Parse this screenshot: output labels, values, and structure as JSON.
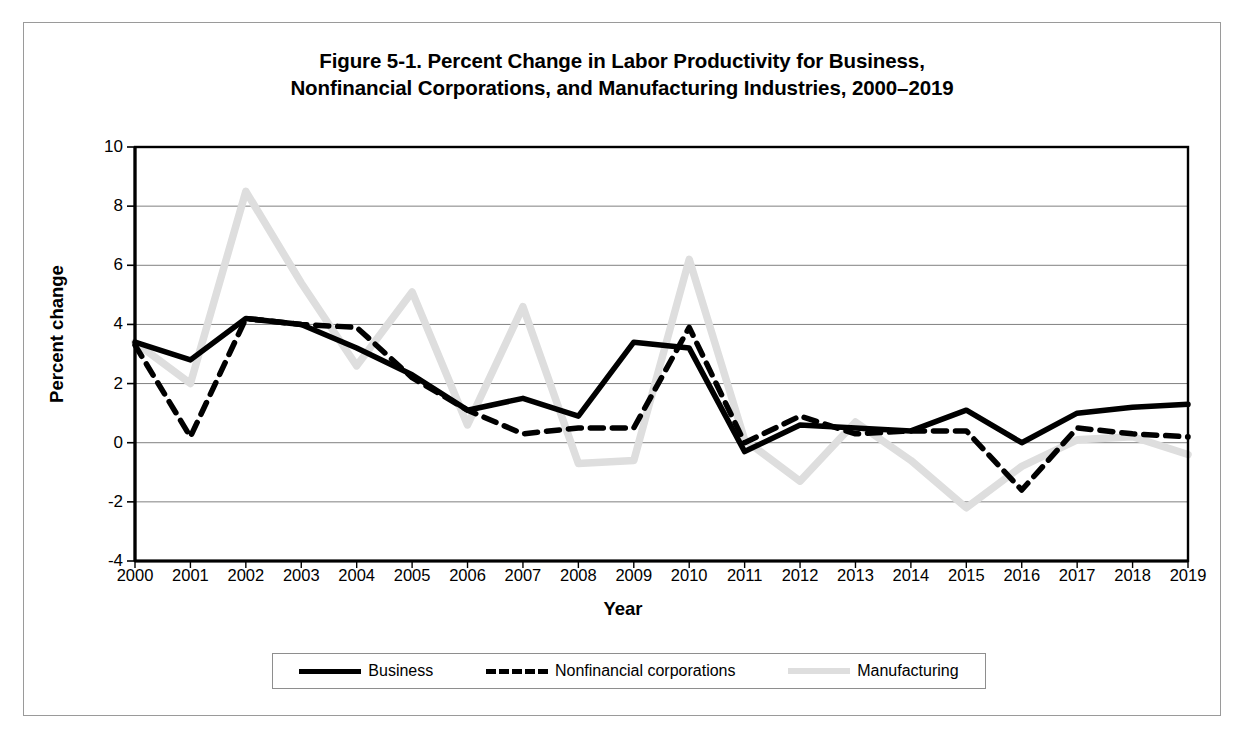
{
  "figure": {
    "title_line1": "Figure 5-1. Percent Change in Labor Productivity for Business,",
    "title_line2": "Nonfinancial Corporations, and Manufacturing Industries, 2000–2019"
  },
  "colors": {
    "business": "#000000",
    "nonfinancial": "#000000",
    "manufacturing": "#dedede",
    "gridline": "#808080",
    "axis": "#000000",
    "frame": "#9a9a9a"
  },
  "chart_data": {
    "type": "line",
    "title": "Figure 5-1. Percent Change in Labor Productivity for Business, Nonfinancial Corporations, and Manufacturing Industries, 2000–2019",
    "xlabel": "Year",
    "ylabel": "Percent change",
    "categories": [
      2000,
      2001,
      2002,
      2003,
      2004,
      2005,
      2006,
      2007,
      2008,
      2009,
      2010,
      2011,
      2012,
      2013,
      2014,
      2015,
      2016,
      2017,
      2018,
      2019
    ],
    "xtick_labels": [
      "2000",
      "2001",
      "2002",
      "2003",
      "2004",
      "2005",
      "2006",
      "2007",
      "2008",
      "2009",
      "2010",
      "2011",
      "2012",
      "2013",
      "2014",
      "2015",
      "2016",
      "2017",
      "2018",
      "2019"
    ],
    "ylim": [
      -4,
      10
    ],
    "yticks": [
      10,
      8,
      6,
      4,
      2,
      0,
      -2,
      -4
    ],
    "ytick_labels": [
      "10",
      "8",
      "6",
      "4",
      "2",
      "0",
      "-2",
      "-4"
    ],
    "grid": true,
    "legend_position": "bottom",
    "series": [
      {
        "name": "Business",
        "style": "solid",
        "color": "#000000",
        "values": [
          3.4,
          2.8,
          4.2,
          4.0,
          3.2,
          2.3,
          1.1,
          1.5,
          0.9,
          3.4,
          3.2,
          -0.3,
          0.6,
          0.5,
          0.4,
          1.1,
          0.0,
          1.0,
          1.2,
          1.3
        ]
      },
      {
        "name": "Nonfinancial corporations",
        "style": "dashed",
        "color": "#000000",
        "values": [
          3.3,
          0.2,
          4.2,
          4.0,
          3.9,
          2.2,
          1.1,
          0.3,
          0.5,
          0.5,
          3.9,
          0.0,
          0.9,
          0.3,
          0.4,
          0.4,
          -1.6,
          0.5,
          0.3,
          0.2
        ]
      },
      {
        "name": "Manufacturing",
        "style": "light-solid",
        "color": "#dedede",
        "values": [
          3.4,
          2.0,
          8.5,
          5.4,
          2.6,
          5.1,
          0.6,
          4.6,
          -0.7,
          -0.6,
          6.2,
          0.1,
          -1.3,
          0.7,
          -0.6,
          -2.2,
          -0.8,
          0.1,
          0.2,
          -0.4
        ]
      }
    ]
  },
  "legend": {
    "items": [
      {
        "label": "Business",
        "style": "solid"
      },
      {
        "label": "Nonfinancial corporations",
        "style": "dashed"
      },
      {
        "label": "Manufacturing",
        "style": "light"
      }
    ]
  }
}
